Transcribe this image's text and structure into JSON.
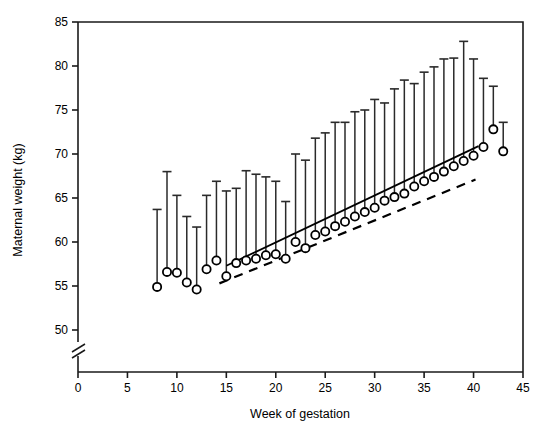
{
  "chart_data": {
    "type": "scatter",
    "title": "",
    "xlabel": "Week of gestation",
    "ylabel": "Maternal weight (kg)",
    "xlim": [
      0,
      45
    ],
    "ylim": [
      50,
      85
    ],
    "xticks": [
      0,
      5,
      10,
      15,
      20,
      25,
      30,
      35,
      40,
      45
    ],
    "yticks": [
      50,
      55,
      60,
      65,
      70,
      75,
      80,
      85
    ],
    "grid": false,
    "legend": null,
    "y_axis_break": true,
    "y_axis_break_note": "axis break below 50 kg",
    "marker": "open-circle",
    "errorbar": "upper only (mean to upper limit)",
    "x": [
      8,
      9,
      10,
      11,
      12,
      13,
      14,
      15,
      16,
      17,
      18,
      19,
      20,
      21,
      22,
      23,
      24,
      25,
      26,
      27,
      28,
      29,
      30,
      31,
      32,
      33,
      34,
      35,
      36,
      37,
      38,
      39,
      40,
      41,
      42,
      43
    ],
    "values": [
      54.9,
      56.6,
      56.5,
      55.4,
      54.6,
      56.9,
      57.9,
      56.1,
      57.6,
      57.9,
      58.1,
      58.5,
      58.6,
      58.1,
      60.0,
      59.3,
      60.8,
      61.2,
      61.8,
      62.3,
      62.9,
      63.4,
      63.9,
      64.7,
      65.1,
      65.5,
      66.3,
      66.9,
      67.4,
      68.0,
      68.6,
      69.2,
      69.8,
      70.8,
      72.8,
      70.3
    ],
    "upper": [
      63.7,
      68.0,
      65.3,
      62.9,
      61.7,
      65.3,
      66.9,
      65.8,
      66.1,
      68.1,
      67.7,
      67.4,
      66.9,
      64.6,
      70.0,
      69.3,
      71.8,
      72.4,
      73.6,
      73.6,
      74.8,
      75.0,
      76.2,
      75.8,
      77.4,
      78.4,
      78.0,
      79.3,
      79.9,
      80.8,
      80.9,
      82.8,
      80.8,
      78.6,
      77.7,
      73.6
    ],
    "trend_solid": {
      "label": "regression line",
      "x": [
        15.0,
        40.5
      ],
      "y": [
        57.3,
        70.9
      ]
    },
    "trend_dashed": {
      "label": "reference line",
      "x": [
        14.3,
        40.2
      ],
      "y": [
        55.3,
        67.1
      ]
    }
  },
  "axis": {
    "x_tick_labels": [
      "0",
      "5",
      "10",
      "15",
      "20",
      "25",
      "30",
      "35",
      "40",
      "45"
    ],
    "y_tick_labels": [
      "50",
      "55",
      "60",
      "65",
      "70",
      "75",
      "80",
      "85"
    ],
    "x_title": "Week of gestation",
    "y_title": "Maternal weight (kg)"
  },
  "colors": {
    "axis": "#000000",
    "marker": "#000000",
    "errorbar": "#333333",
    "background": "#ffffff"
  }
}
